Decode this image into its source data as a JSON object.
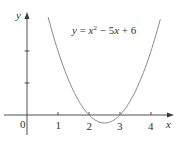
{
  "chart_data": {
    "type": "line",
    "title": "",
    "annotation": "y = x² − 5x + 6",
    "function": "x^2 - 5x + 6",
    "xlabel": "x",
    "ylabel": "y",
    "origin_label": "0",
    "x_ticks": [
      1,
      2,
      3,
      4
    ],
    "x_tick_labels": [
      "1",
      "2",
      "3",
      "4"
    ],
    "y_ticks": [
      1,
      2
    ],
    "y_tick_labels": [],
    "xlim": [
      -0.55,
      4.75
    ],
    "ylim": [
      -0.9,
      3.2
    ],
    "grid": false,
    "legend": "none",
    "roots": [
      2,
      3
    ],
    "vertex": [
      2.5,
      -0.25
    ],
    "series": [
      {
        "name": "y = x^2 - 5x + 6",
        "x": [
          0.68,
          1.0,
          1.5,
          2.0,
          2.25,
          2.5,
          2.75,
          3.0,
          3.5,
          4.0,
          4.3
        ],
        "y": [
          3.06,
          2.0,
          0.75,
          0.0,
          -0.19,
          -0.25,
          -0.19,
          0.0,
          0.75,
          2.0,
          2.99
        ]
      }
    ],
    "colors": {
      "axis": "#3a3a3a",
      "curve": "#8a8a8a",
      "text": "#333333"
    }
  },
  "labels": {
    "eq_y": "y",
    "eq_eq": " = ",
    "eq_x": "x",
    "eq_sup": "2",
    "eq_rest_minus": " − 5",
    "eq_rest_x": "x",
    "eq_rest_plus": " + 6",
    "x_axis": "x",
    "y_axis": "y",
    "origin": "0",
    "tick1": "1",
    "tick2": "2",
    "tick3": "3",
    "tick4": "4"
  }
}
